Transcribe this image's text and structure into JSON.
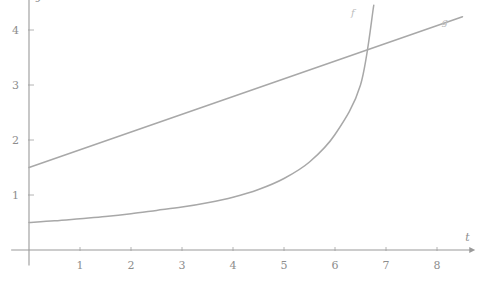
{
  "chart_data": {
    "type": "line",
    "title": "",
    "xlabel": "t",
    "ylabel": "y",
    "xlim": [
      -0.35,
      8.75
    ],
    "ylim": [
      -0.28,
      4.6
    ],
    "grid": false,
    "legend_position": "inline-at-curve-end",
    "xticks": [
      1,
      2,
      3,
      4,
      5,
      6,
      7,
      8
    ],
    "xtick_labels": [
      "1",
      "2",
      "3",
      "4",
      "5",
      "6",
      "7",
      "8"
    ],
    "yticks": [
      1,
      2,
      3,
      4
    ],
    "ytick_labels": [
      "1",
      "2",
      "3",
      "4"
    ],
    "series": [
      {
        "name": "f",
        "label": "f",
        "kind": "exponential",
        "color": "#a8a8a8",
        "label_x": 6.35,
        "label_y": 4.25,
        "x": [
          0,
          0.5,
          1,
          1.5,
          2,
          2.5,
          3,
          3.5,
          4,
          4.5,
          5,
          5.5,
          6,
          6.5,
          6.76
        ],
        "y": [
          0.5,
          0.53,
          0.57,
          0.61,
          0.66,
          0.72,
          0.78,
          0.86,
          0.96,
          1.1,
          1.3,
          1.6,
          2.1,
          3.0,
          4.45
        ]
      },
      {
        "name": "g",
        "label": "g",
        "kind": "linear",
        "color": "#a8a8a8",
        "label_x": 8.15,
        "label_y": 4.1,
        "x": [
          0,
          8.5
        ],
        "y": [
          1.5,
          4.24
        ]
      }
    ],
    "intersection": {
      "t": 6.5,
      "y": 3.7
    },
    "annotations": []
  },
  "axes": {
    "x_axis_name": "t-axis",
    "y_axis_name": "y-axis",
    "x_label": "t",
    "y_label": "y"
  }
}
